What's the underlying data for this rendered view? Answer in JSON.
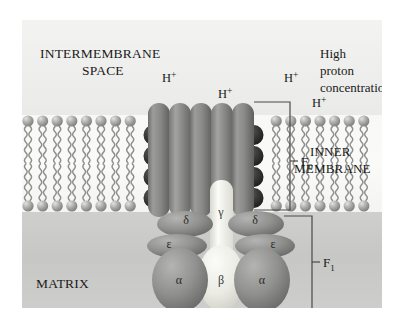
{
  "figure": {
    "regions": {
      "intermembrane_space_label_line1": "INTERMEMBRANE",
      "intermembrane_space_label_line2": "SPACE",
      "matrix_label": "MATRIX",
      "inner_membrane_label_line1": "INNER",
      "inner_membrane_label_line2": "MEMBRANE",
      "proton_note_line1": "High",
      "proton_note_line2": "proton",
      "proton_note_line3": "concentration"
    },
    "protons": [
      {
        "label": "H",
        "charge": "+",
        "x": 140,
        "y": 62
      },
      {
        "label": "H",
        "charge": "+",
        "x": 196,
        "y": 78
      },
      {
        "label": "H",
        "charge": "+",
        "x": 262,
        "y": 62
      },
      {
        "label": "H",
        "charge": "+",
        "x": 290,
        "y": 87
      }
    ],
    "brackets": [
      {
        "name": "F0",
        "label": "F",
        "subscript": "0"
      },
      {
        "name": "F1",
        "label": "F",
        "subscript": "1"
      }
    ],
    "subunits": [
      {
        "name": "gamma",
        "glyph": "γ",
        "x": 199,
        "y": 196,
        "tone": "light"
      },
      {
        "name": "delta-left",
        "glyph": "δ",
        "x": 164,
        "y": 204,
        "tone": "dark"
      },
      {
        "name": "delta-right",
        "glyph": "δ",
        "x": 233,
        "y": 204,
        "tone": "dark"
      },
      {
        "name": "epsilon-left",
        "glyph": "ε",
        "x": 147,
        "y": 228,
        "tone": "dark"
      },
      {
        "name": "epsilon-right",
        "glyph": "ε",
        "x": 251,
        "y": 228,
        "tone": "dark"
      },
      {
        "name": "alpha-left",
        "glyph": "α",
        "x": 157,
        "y": 264,
        "tone": "dark"
      },
      {
        "name": "beta-center",
        "glyph": "β",
        "x": 199,
        "y": 264,
        "tone": "light"
      },
      {
        "name": "alpha-right",
        "glyph": "α",
        "x": 240,
        "y": 264,
        "tone": "dark"
      }
    ],
    "colors": {
      "space_background": "#f0f0ee",
      "membrane_background": "#f7f7f5",
      "matrix_background": "#c9c9c7",
      "lipid_head": "#a8a8a6",
      "lipid_tail": "#8d8d8b",
      "protein_dark": "#8e8e8c",
      "protein_light": "#ebebe6",
      "c_ring": "#3a3a38",
      "bracket_line": "#4a4a48",
      "text": "#1a1a1a"
    }
  }
}
